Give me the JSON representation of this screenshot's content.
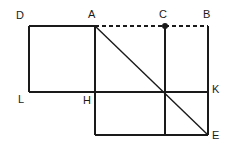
{
  "figure": {
    "canvas": {
      "width": 232,
      "height": 148
    },
    "style": {
      "stroke_color": "#1a1a1a",
      "background_color": "#ffffff",
      "stroke_width": 1.4,
      "dash_pattern": "4,3",
      "point_radius": 3
    },
    "labels": {
      "D": "D",
      "A": "A",
      "C": "C",
      "B": "B",
      "L": "L",
      "H": "H",
      "K": "K",
      "E": "E"
    },
    "points": [
      {
        "name": "D",
        "x": 29,
        "y": 26,
        "label": "D",
        "label_x": 16,
        "label_y": 10,
        "marked": false
      },
      {
        "name": "A",
        "x": 95,
        "y": 26,
        "label": "A",
        "label_x": 88,
        "label_y": 9,
        "marked": false
      },
      {
        "name": "C",
        "x": 165,
        "y": 26,
        "label": "C",
        "label_x": 159,
        "label_y": 9,
        "marked": true
      },
      {
        "name": "B",
        "x": 208,
        "y": 26,
        "label": "B",
        "label_x": 203,
        "label_y": 9,
        "marked": false
      },
      {
        "name": "L",
        "x": 29,
        "y": 92,
        "label": "L",
        "label_x": 18,
        "label_y": 94,
        "marked": false
      },
      {
        "name": "H",
        "x": 95,
        "y": 92,
        "label": "H",
        "label_x": 83,
        "label_y": 95,
        "marked": false
      },
      {
        "name": "K",
        "x": 208,
        "y": 92,
        "label": "K",
        "label_x": 212,
        "label_y": 84,
        "marked": false
      },
      {
        "name": "E",
        "x": 208,
        "y": 135,
        "label": "E",
        "label_x": 212,
        "label_y": 130,
        "marked": false
      }
    ],
    "segments": [
      {
        "name": "segment-D-A",
        "from": "D",
        "to": "A",
        "x1": 29,
        "y1": 26,
        "x2": 95,
        "y2": 26,
        "dashed": false
      },
      {
        "name": "segment-A-B",
        "from": "A",
        "to": "B",
        "x1": 95,
        "y1": 26,
        "x2": 208,
        "y2": 26,
        "dashed": true
      },
      {
        "name": "segment-D-L",
        "from": "D",
        "to": "L",
        "x1": 29,
        "y1": 26,
        "x2": 29,
        "y2": 92,
        "dashed": false
      },
      {
        "name": "segment-L-K",
        "from": "L",
        "to": "K",
        "x1": 29,
        "y1": 92,
        "x2": 208,
        "y2": 92,
        "dashed": false
      },
      {
        "name": "segment-A-bottom",
        "from": "A",
        "to": "F",
        "x1": 95,
        "y1": 26,
        "x2": 95,
        "y2": 135,
        "dashed": false
      },
      {
        "name": "segment-C-bottom",
        "from": "C",
        "to": "G",
        "x1": 165,
        "y1": 26,
        "x2": 165,
        "y2": 135,
        "dashed": false
      },
      {
        "name": "segment-B-E",
        "from": "B",
        "to": "E",
        "x1": 208,
        "y1": 26,
        "x2": 208,
        "y2": 135,
        "dashed": false
      },
      {
        "name": "segment-F-E",
        "from": "F",
        "to": "E",
        "x1": 95,
        "y1": 135,
        "x2": 208,
        "y2": 135,
        "dashed": false
      },
      {
        "name": "segment-A-E",
        "from": "A",
        "to": "E",
        "x1": 95,
        "y1": 26,
        "x2": 208,
        "y2": 135,
        "dashed": false
      }
    ]
  }
}
